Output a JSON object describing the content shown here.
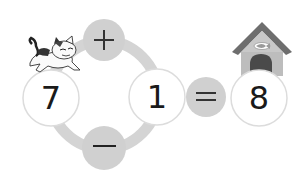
{
  "puzzle": {
    "left_operand": "7",
    "right_operand": "1",
    "result": "8",
    "operator_top": "+",
    "operator_bottom": "−",
    "equals": "="
  },
  "colors": {
    "ring": "#d4d4d4",
    "operator_bubble": "#d0d0d0",
    "number_circle_border": "#dcdcdc",
    "house_roof": "#6e6e6e",
    "house_wall": "#bdbdbd",
    "house_door": "#4a4a4a"
  },
  "icons": {
    "cat": "cat-icon",
    "house": "house-icon"
  }
}
